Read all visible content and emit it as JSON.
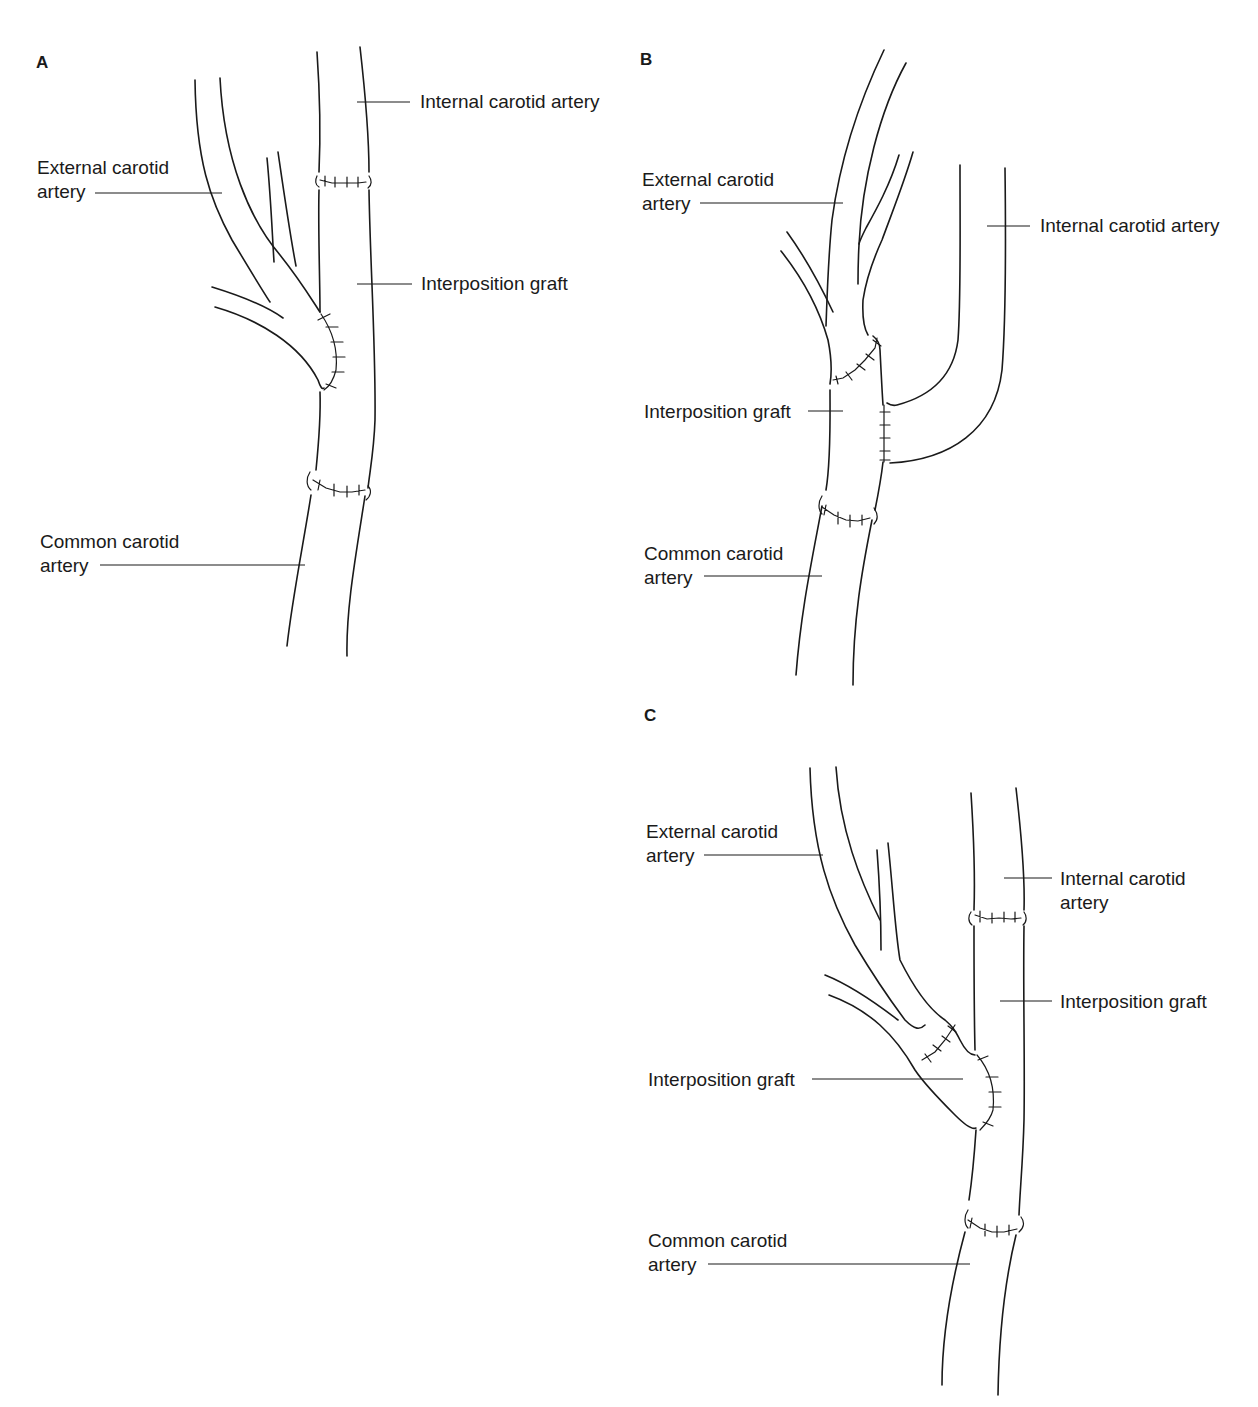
{
  "figure": {
    "panels": [
      {
        "letter": "A",
        "labels": {
          "internal": "Internal carotid artery",
          "external_line1": "External carotid",
          "external_line2": "artery",
          "graft": "Interposition graft",
          "common_line1": "Common carotid",
          "common_line2": "artery"
        }
      },
      {
        "letter": "B",
        "labels": {
          "external_line1": "External carotid",
          "external_line2": "artery",
          "internal": "Internal carotid artery",
          "graft": "Interposition graft",
          "common_line1": "Common carotid",
          "common_line2": "artery"
        }
      },
      {
        "letter": "C",
        "labels": {
          "external_line1": "External carotid",
          "external_line2": "artery",
          "internal_line1": "Internal carotid",
          "internal_line2": "artery",
          "graft_right": "Interposition graft",
          "graft_left": "Interposition graft",
          "common_line1": "Common carotid",
          "common_line2": "artery"
        }
      }
    ]
  }
}
